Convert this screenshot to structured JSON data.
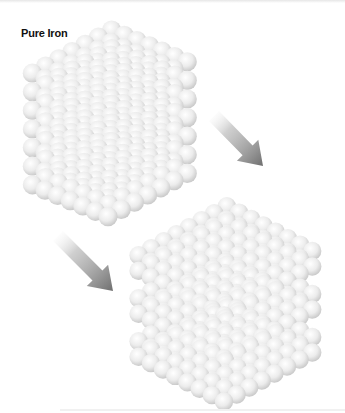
{
  "title": "Pure Iron",
  "colors": {
    "sphere_highlight": "#ffffff",
    "sphere_mid": "#ececec",
    "sphere_shadow": "#c4c4c4",
    "arrow_dark": "#6e6e6e",
    "arrow_light": "#ffffff"
  },
  "structures": [
    {
      "name": "solid-cube",
      "origin": [
        108,
        105
      ],
      "nx": 7,
      "ny": 7,
      "nz": 7,
      "step_x": [
        13.2,
        -7.2
      ],
      "step_y": [
        -12.6,
        -5.3
      ],
      "step_z": 18.6,
      "radius": 9.6,
      "slab_layers": 7,
      "slab_gap": 0
    },
    {
      "name": "separated-slabs",
      "origin": [
        224,
        300
      ],
      "nx": 8,
      "ny": 8,
      "nz": 6,
      "step_x": [
        12.6,
        -7.0
      ],
      "step_y": [
        -12.2,
        -6.4
      ],
      "step_z": 15.5,
      "radius": 9.2,
      "slab_layers": 2,
      "slab_gap": 12
    }
  ],
  "arrows": [
    {
      "name": "arrow-down-right-1",
      "tail": [
        214,
        116
      ],
      "head": [
        263,
        166
      ]
    },
    {
      "name": "arrow-down-right-2",
      "tail": [
        58,
        236
      ],
      "head": [
        113,
        291
      ]
    }
  ]
}
